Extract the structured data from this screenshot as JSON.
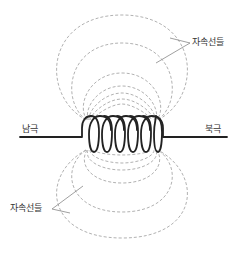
{
  "diagram": {
    "type": "solenoid-magnetic-field",
    "labels": {
      "south_pole": "남극",
      "north_pole": "북극",
      "flux_lines_top": "자속선들",
      "flux_lines_bottom": "자속선들"
    },
    "coil": {
      "turns": 6
    },
    "colors": {
      "wire": "#222222",
      "flux_line": "#a8a8a8",
      "leader": "#888888",
      "text": "#333333"
    }
  }
}
